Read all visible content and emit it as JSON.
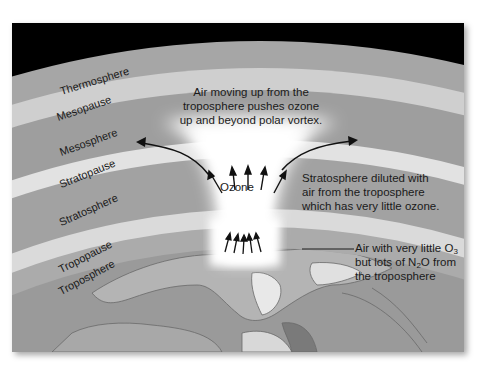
{
  "diagram": {
    "layers": [
      {
        "name": "Thermosphere",
        "color": "#a6a6a6"
      },
      {
        "name": "Mesopause",
        "color": "#cfcfcf"
      },
      {
        "name": "Mesosphere",
        "color": "#9e9e9e"
      },
      {
        "name": "Stratopause",
        "color": "#e2e2e2"
      },
      {
        "name": "Stratosphere",
        "color": "#a2a2a2"
      },
      {
        "name": "Tropopause",
        "color": "#dadada"
      },
      {
        "name": "Troposphere",
        "color": "#ababab"
      }
    ],
    "space_color": "#000000",
    "earth_color": "#9a9a9a",
    "annotations": {
      "top": "Air moving up from the troposphere pushes ozone up and beyond polar vortex.",
      "top_lines": [
        "Air moving up from the",
        "troposphere pushes ozone",
        "up and beyond polar vortex."
      ],
      "center": "Ozone",
      "right_mid_lines": [
        "Stratosphere diluted with",
        "air from the troposphere",
        "which has very little ozone."
      ],
      "right_low": {
        "line1_prefix": "Air with very little O",
        "line1_sub": "3",
        "line2_prefix": "but lots of N",
        "line2_sub": "2",
        "line2_suffix": "O from",
        "line3": "the troposphere"
      }
    },
    "arrows": {
      "upper_group_count": 5,
      "lower_group_count": 5,
      "curved_outward": 2
    }
  }
}
